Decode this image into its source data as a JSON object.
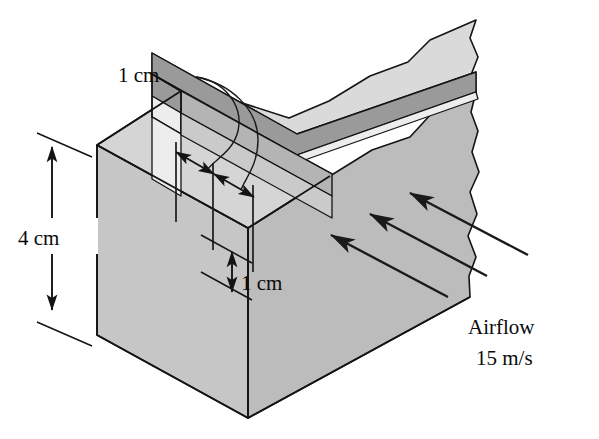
{
  "figure": {
    "background_color": "#ffffff",
    "line_color": "#141414"
  },
  "solid": {
    "name": "rectangular-block-with-groove",
    "faces": {
      "top_front_label": "top-face-front",
      "top_back_label": "top-face-back",
      "front_label": "front-face",
      "right_label": "right-face",
      "groove_wall_label": "groove-far-wall",
      "groove_floor_label": "groove-floor",
      "groove_near_wall_label": "groove-near-wall"
    },
    "colors": {
      "top_face": "#d5d5d5",
      "front_face": "#c6c6c6",
      "right_face": "#bcbcbc",
      "groove_far_wall": "#9a9a9a",
      "groove_floor": "#e2e2e2",
      "groove_near_wall_light": "#ededed",
      "groove_inner_shadow": "#b4b4b4",
      "edge": "#141414"
    },
    "edge_style": "torn-break-edge-on-right"
  },
  "dimensions": [
    {
      "id": "height",
      "label": "4 cm",
      "value": 4,
      "unit": "cm",
      "orientation": "vertical",
      "describes": "block overall height",
      "text_x": 25,
      "text_y": 238,
      "arrow_x": 48,
      "arrow_top_y": 147,
      "arrow_bottom_y": 310
    },
    {
      "id": "groove-width",
      "label": "1 cm",
      "value": 1,
      "unit": "cm",
      "orientation": "diagonal",
      "describes": "groove width and land width along top face",
      "text_x": 120,
      "text_y": 75
    },
    {
      "id": "groove-depth",
      "label": "1 cm",
      "value": 1,
      "unit": "cm",
      "orientation": "vertical",
      "describes": "groove depth",
      "text_x": 245,
      "text_y": 295,
      "arrow_x": 232,
      "arrow_top_y": 252,
      "arrow_bottom_y": 292
    }
  ],
  "airflow": {
    "name": "airflow-annotation",
    "label_line_1": "Airflow",
    "label_line_2": "15 m/s",
    "speed_value": 15,
    "speed_unit": "m/s",
    "direction": "up-and-to-the-left",
    "arrow_count": 3,
    "text_x": 470,
    "text_y_1": 326,
    "text_y_2": 357,
    "arrows": [
      {
        "x1": 448,
        "y1": 297,
        "x2": 331,
        "y2": 235
      },
      {
        "x1": 487,
        "y1": 276,
        "x2": 370,
        "y2": 214
      },
      {
        "x1": 528,
        "y1": 255,
        "x2": 410,
        "y2": 193
      }
    ]
  }
}
